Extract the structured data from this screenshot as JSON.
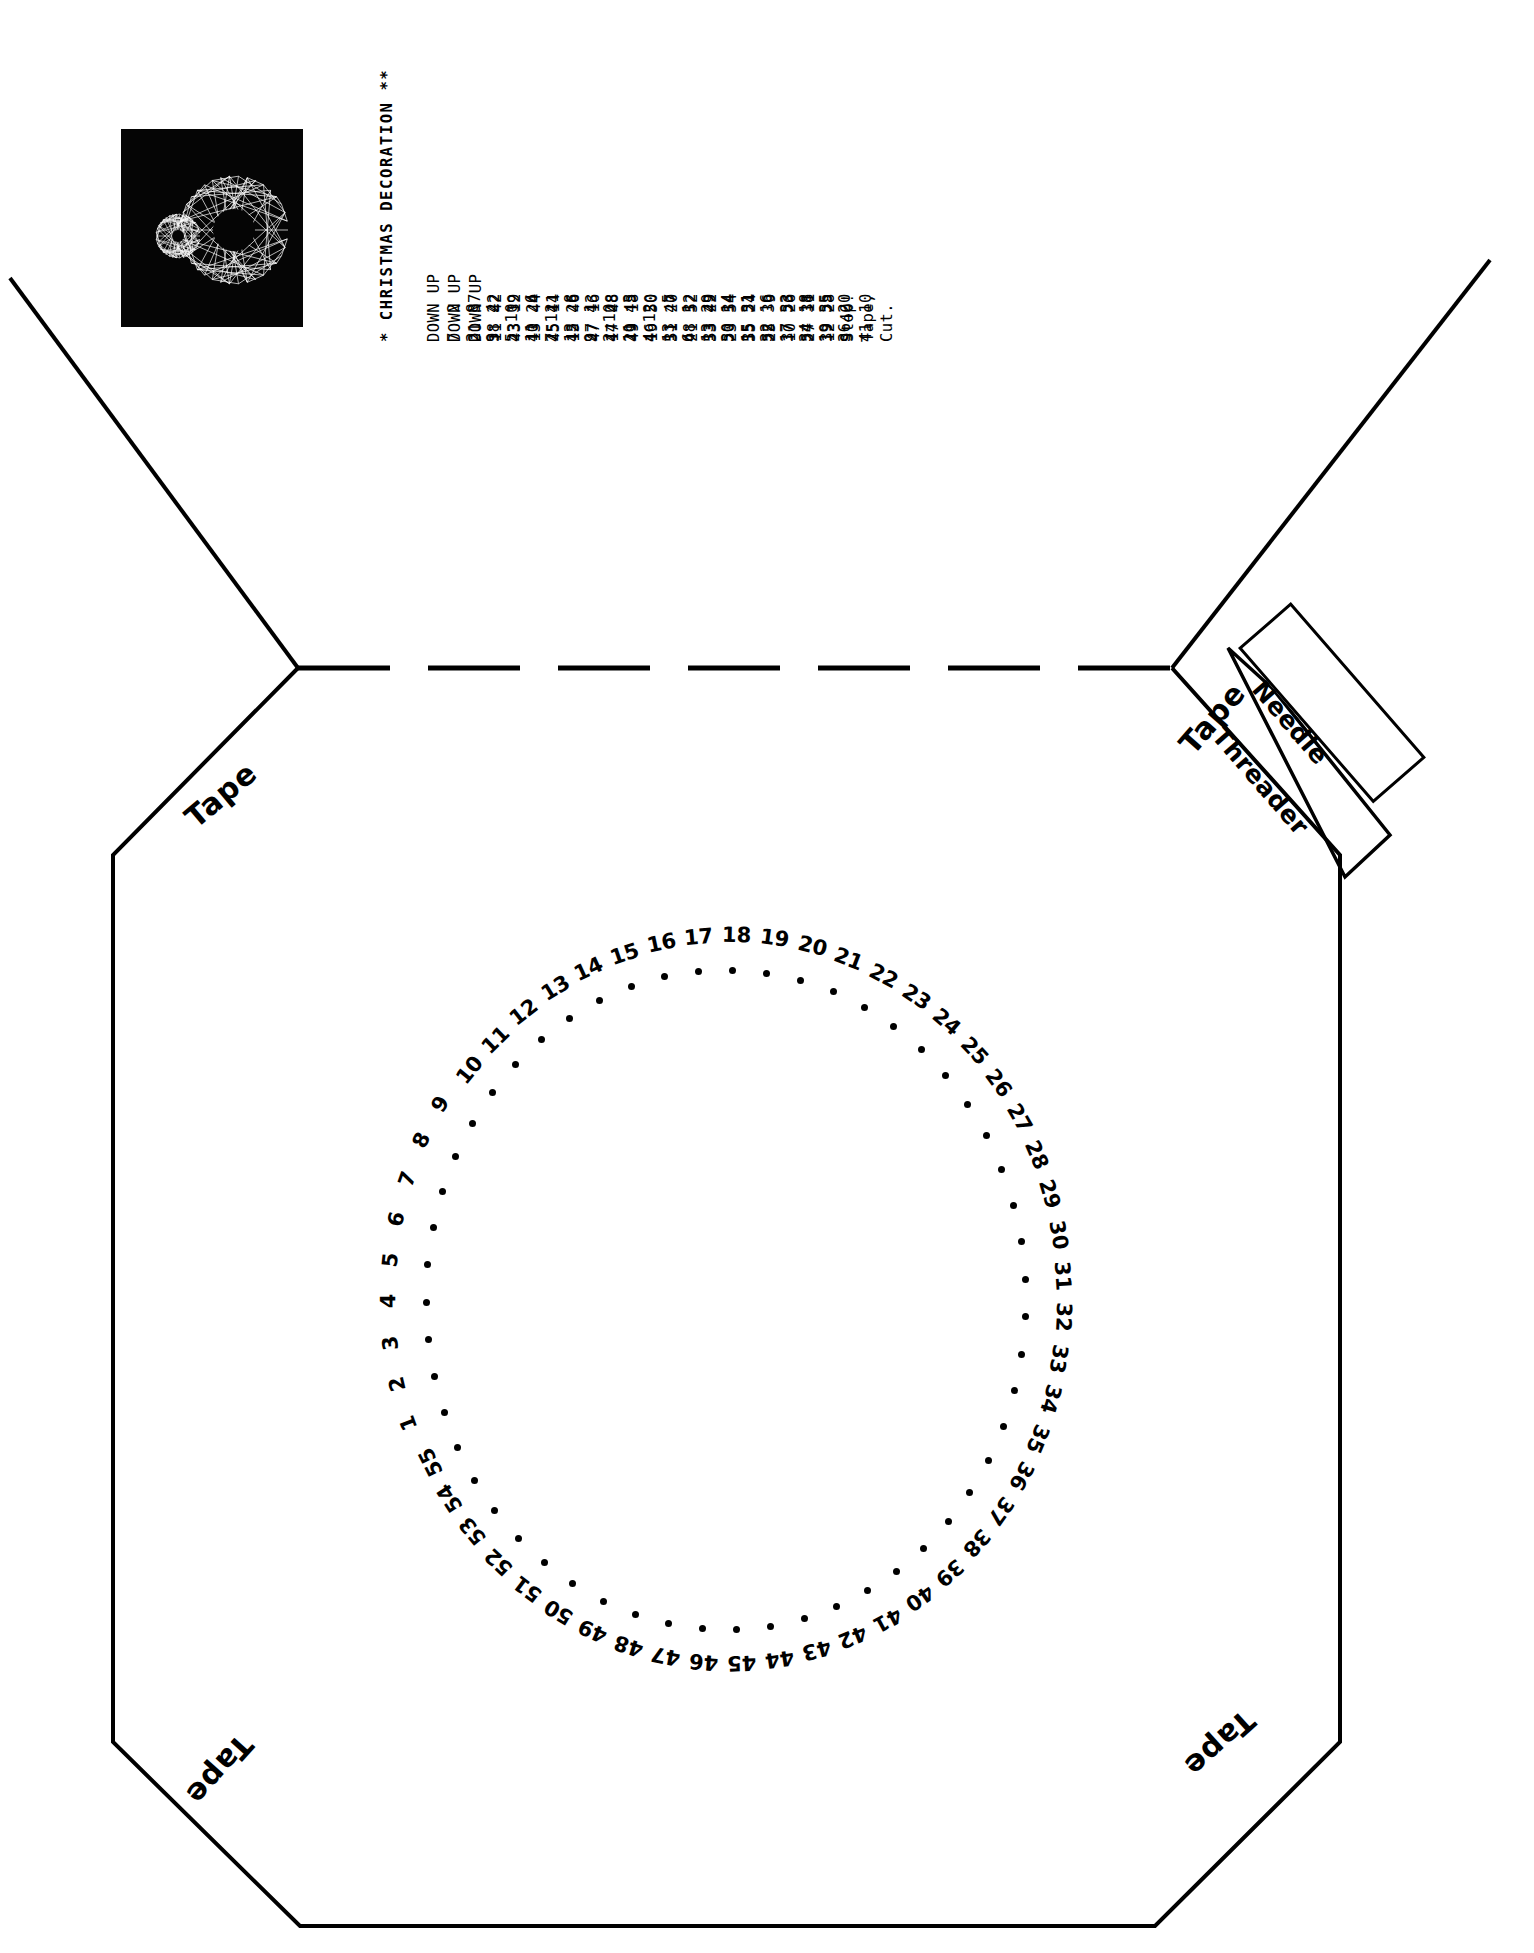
{
  "document": {
    "title": "* CHRISTMAS DECORATION **",
    "kind": "string-art stitching template"
  },
  "photo": {
    "caption_name": "finished-decoration-photo",
    "background": "#050505",
    "thread_color": "#ffffff"
  },
  "stitch_table": {
    "column_headers": [
      "DOWN",
      "UP",
      "DOWN",
      "UP",
      "DOWN",
      "UP"
    ],
    "columns": [
      {
        "header_down": "DOWN",
        "header_up": "UP",
        "rows": [
          "7  2",
          "3  8",
          "9  4",
          "5 10",
          "11  6",
          "7 12",
          "13  8",
          "9  1",
          "2 10",
          "11  3",
          "4 12",
          "13  5",
          "6  1",
          "13 29",
          "30 14",
          "15 31",
          "32 16",
          "17 33",
          "34 18",
          "19 35",
          "36 20"
        ]
      },
      {
        "header_down": "DOWN",
        "header_up": "UP",
        "rows": [
          "21 37",
          "38 22",
          "23 39",
          "40 24",
          "25 41",
          "42 26",
          "27 43",
          "44 28",
          "29 45",
          "46 30",
          "31 47",
          "48 32",
          "33 49",
          "50 34",
          "35 51",
          "52 36",
          "37 53",
          "54 38",
          "39 55",
          "9 40",
          "41 10"
        ]
      },
      {
        "header_down": "DOWN",
        "header_up": "UP",
        "rows": [
          "11 42",
          "43 12",
          "13 44",
          "45 14",
          "15 46",
          "47 16",
          "17 48",
          "49 18",
          "19 50",
          "51 20",
          "21 52",
          "53 22",
          "23 54",
          "55 24",
          "25  9",
          "10 26",
          "27 11",
          "12 28",
          "Stop!",
          "Tape,",
          "Cut."
        ]
      }
    ],
    "terminal_notes": [
      "Stop!",
      "Tape,",
      "Cut."
    ]
  },
  "card": {
    "fold_line_label": "dashed-fold-line",
    "tape_labels": [
      {
        "id": "tape-top-left",
        "text": "Tape"
      },
      {
        "id": "tape-top-right",
        "text": "Tape"
      },
      {
        "id": "tape-bottom-left",
        "text": "Tape"
      },
      {
        "id": "tape-bottom-right",
        "text": "Tape"
      }
    ],
    "needle_threader": {
      "line1": "Needle",
      "line2": "Threader"
    }
  },
  "ring": {
    "count": 55,
    "labels": [
      "1",
      "2",
      "3",
      "4",
      "5",
      "6",
      "7",
      "8",
      "9",
      "10",
      "11",
      "12",
      "13",
      "14",
      "15",
      "16",
      "17",
      "18",
      "19",
      "20",
      "21",
      "22",
      "23",
      "24",
      "25",
      "26",
      "27",
      "28",
      "29",
      "30",
      "31",
      "32",
      "33",
      "34",
      "35",
      "36",
      "37",
      "38",
      "39",
      "40",
      "41",
      "42",
      "43",
      "44",
      "45",
      "46",
      "47",
      "48",
      "49",
      "50",
      "51",
      "52",
      "53",
      "54",
      "55"
    ]
  },
  "colors": {
    "ink": "#000000",
    "paper": "#ffffff",
    "photo_bg": "#050505"
  }
}
